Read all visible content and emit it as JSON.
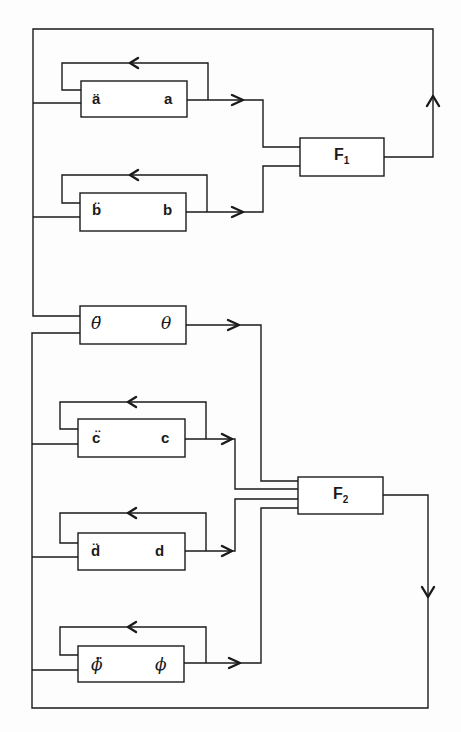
{
  "diagram": {
    "type": "block-diagram",
    "integrators": [
      {
        "id": "a",
        "input_label": "ä",
        "output_label": "a",
        "self_feedback": true,
        "feeds": "F1"
      },
      {
        "id": "b",
        "input_label": "b̈",
        "output_label": "b",
        "self_feedback": true,
        "feeds": "F1"
      },
      {
        "id": "theta",
        "input_label": "θ̈",
        "output_label": "θ",
        "self_feedback": false,
        "feeds": "F2"
      },
      {
        "id": "c",
        "input_label": "c̈",
        "output_label": "c",
        "self_feedback": true,
        "feeds": "F2"
      },
      {
        "id": "d",
        "input_label": "d̈",
        "output_label": "d",
        "self_feedback": true,
        "feeds": "F2"
      },
      {
        "id": "phi",
        "input_label": "ϕ̈",
        "output_label": "ϕ",
        "self_feedback": true,
        "feeds": "F2"
      }
    ],
    "function_blocks": [
      {
        "id": "F1",
        "label": "F",
        "subscript": "1",
        "inputs": [
          "a",
          "b"
        ],
        "output_feeds": [
          "a",
          "b",
          "theta"
        ]
      },
      {
        "id": "F2",
        "label": "F",
        "subscript": "2",
        "inputs": [
          "theta",
          "c",
          "d",
          "phi"
        ],
        "output_feeds": [
          "theta",
          "c",
          "d",
          "phi"
        ]
      }
    ],
    "colors": {
      "line": "#1a1a1a",
      "background": "#fdfdfd"
    }
  }
}
